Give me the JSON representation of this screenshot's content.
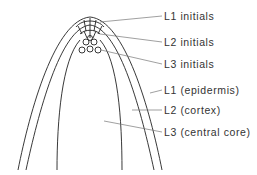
{
  "diagram": {
    "labels": [
      {
        "id": "l1-initials",
        "text": "L1 initials",
        "y": 10
      },
      {
        "id": "l2-initials",
        "text": "L2 initials",
        "y": 36
      },
      {
        "id": "l3-initials",
        "text": "L3 initials",
        "y": 58
      },
      {
        "id": "l1-epidermis",
        "text": "L1 (epidermis)",
        "y": 84
      },
      {
        "id": "l2-cortex",
        "text": "L2 (cortex)",
        "y": 104
      },
      {
        "id": "l3-central-core",
        "text": "L3 (central core)",
        "y": 126
      }
    ],
    "colors": {
      "line": "#222222",
      "leader": "#777777",
      "text": "#333333",
      "background": "#ffffff"
    }
  }
}
